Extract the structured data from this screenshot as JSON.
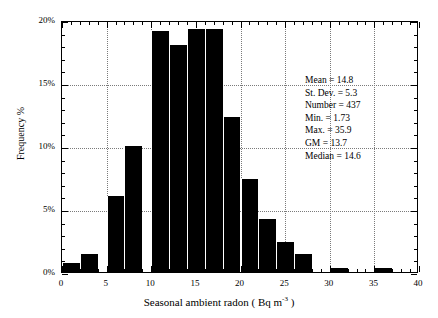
{
  "chart_data": {
    "type": "bar",
    "title": "",
    "subtitle": "",
    "xlabel_text": "Seasonal ambient radon ( Bq m",
    "xlabel_sup": "-3",
    "xlabel_tail": " )",
    "xlabel": "Seasonal ambient radon ( Bq m-3 )",
    "ylabel": "Frequency %",
    "xlim": [
      0,
      40
    ],
    "ylim": [
      0,
      20
    ],
    "grid": true,
    "legend": "none",
    "bin_width": 2,
    "x_major_ticks": [
      0,
      5,
      10,
      15,
      20,
      25,
      30,
      35,
      40
    ],
    "x_tick_labels": [
      "0",
      "5",
      "10",
      "15",
      "20",
      "25",
      "30",
      "35",
      "40"
    ],
    "x_minor_step": 1,
    "y_major_ticks": [
      0,
      5,
      10,
      15,
      20
    ],
    "y_tick_labels": [
      "0%",
      "5%",
      "10%",
      "15%",
      "20%"
    ],
    "y_minor_step": 1,
    "bin_starts": [
      0,
      2,
      4,
      6,
      8,
      10,
      12,
      14,
      16,
      18,
      20,
      22,
      24,
      26,
      28,
      30,
      32,
      34,
      36
    ],
    "categories": [
      "0-2",
      "2-4",
      "4-6",
      "6-8",
      "8-10",
      "10-12",
      "12-14",
      "14-16",
      "16-18",
      "18-20",
      "20-22",
      "22-24",
      "24-26",
      "26-28",
      "28-30",
      "30-32",
      "32-34",
      "34-36",
      "36-38"
    ],
    "values": [
      0.7,
      1.4,
      0.0,
      6.0,
      10.0,
      19.1,
      18.0,
      19.3,
      0.0,
      0.0,
      12.3,
      7.4,
      4.2,
      2.4,
      1.4,
      0.3,
      0.0,
      0.0,
      0.3
    ],
    "bars": [
      {
        "start": 0,
        "end": 2,
        "value": 0.7
      },
      {
        "start": 2,
        "end": 4,
        "value": 1.4
      },
      {
        "start": 5,
        "end": 7,
        "value": 6.0
      },
      {
        "start": 7,
        "end": 9,
        "value": 10.0
      },
      {
        "start": 10,
        "end": 12,
        "value": 19.1
      },
      {
        "start": 12,
        "end": 14,
        "value": 18.0
      },
      {
        "start": 14,
        "end": 16,
        "value": 19.3
      },
      {
        "start": 16,
        "end": 18,
        "value": 19.3
      },
      {
        "start": 18,
        "end": 20,
        "value": 12.3
      },
      {
        "start": 20,
        "end": 22,
        "value": 7.4
      },
      {
        "start": 22,
        "end": 24,
        "value": 4.2
      },
      {
        "start": 24,
        "end": 26,
        "value": 2.4
      },
      {
        "start": 26,
        "end": 28,
        "value": 1.4
      },
      {
        "start": 30,
        "end": 32,
        "value": 0.3
      },
      {
        "start": 35,
        "end": 37,
        "value": 0.3
      }
    ]
  },
  "stats": {
    "lines": [
      "Mean = 14.8",
      "St. Dev. = 5.3",
      "Number = 437",
      "Min. = 1.73",
      "Max. = 35.9",
      "GM = 13.7",
      "Median = 14.6"
    ],
    "mean": "Mean = 14.8",
    "stdev": "St. Dev. = 5.3",
    "number": "Number = 437",
    "min": "Min. = 1.73",
    "max": "Max. = 35.9",
    "gm": "GM = 13.7",
    "median": "Median = 14.6"
  },
  "colors": {
    "bar_fill": "#000000",
    "axis": "#000000",
    "grid": "#7a7a7a",
    "background": "#ffffff"
  }
}
